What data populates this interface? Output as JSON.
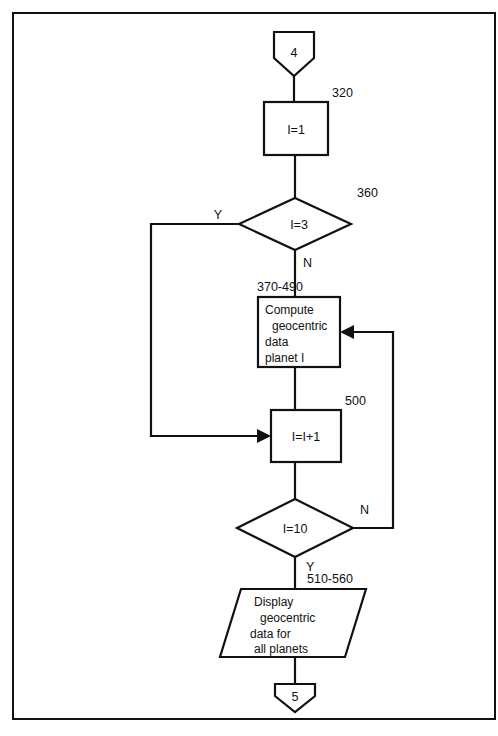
{
  "diagram": {
    "type": "flowchart",
    "background_color": "#ffffff",
    "line_color": "#111111",
    "nodes": [
      {
        "id": "connector-in",
        "shape": "connector-pentagon",
        "label": "4"
      },
      {
        "id": "init-loop",
        "shape": "process-rectangle",
        "label": "I=1",
        "line_number": "320"
      },
      {
        "id": "decision-skip-earth",
        "shape": "decision-diamond",
        "label": "I=3",
        "line_number": "360",
        "yes_label": "Y",
        "no_label": "N"
      },
      {
        "id": "compute-geocentric",
        "shape": "process-rectangle",
        "line_number": "370-490",
        "lines": [
          "Compute",
          "geocentric",
          "data",
          "planet I"
        ]
      },
      {
        "id": "increment-counter",
        "shape": "process-rectangle",
        "label": "I=I+1",
        "line_number": "500"
      },
      {
        "id": "decision-all-planets",
        "shape": "decision-diamond",
        "label": "I=10",
        "yes_label": "Y",
        "no_label": "N"
      },
      {
        "id": "display-results",
        "shape": "io-parallelogram",
        "line_number": "510-560",
        "lines": [
          "Display",
          "geocentric",
          "data for",
          "all planets"
        ]
      },
      {
        "id": "connector-out",
        "shape": "connector-pentagon",
        "label": "5"
      }
    ]
  },
  "caption": {
    "text": ""
  }
}
